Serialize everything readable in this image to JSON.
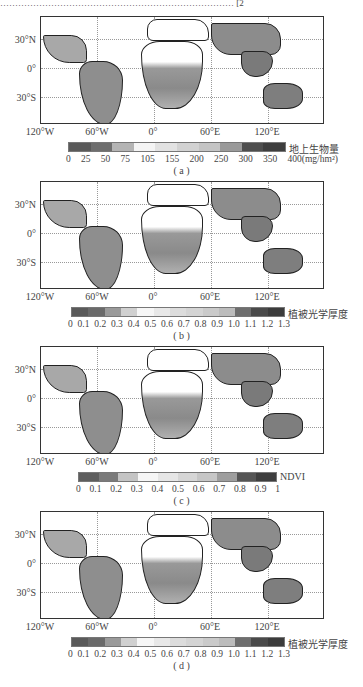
{
  "figure": {
    "top_text_fragment": "…………………………………………………………………… [2",
    "lat_labels": [
      "30°N",
      "0°",
      "30°S"
    ],
    "lon_labels": [
      "120°W",
      "60°W",
      "0°",
      "60°E",
      "120°E"
    ],
    "panels": [
      {
        "id": "a",
        "caption": "( a )",
        "variable_label": "地上生物量",
        "tick_labels": [
          "0",
          "25",
          "50",
          "75",
          "105",
          "155",
          "200",
          "250",
          "300",
          "350",
          "400(mg/hm²)"
        ],
        "colors": [
          "#5a5a5a",
          "#6e6e6e",
          "#b4b4b4",
          "#f4f4f4",
          "#e2e2e2",
          "#d2d2d2",
          "#c4c4c4",
          "#9a9a9a",
          "#4e4e4e",
          "#3e3e3e"
        ]
      },
      {
        "id": "b",
        "caption": "( b )",
        "variable_label": "植被光学厚度",
        "tick_labels": [
          "0",
          "0.1",
          "0.2",
          "0.3",
          "0.4",
          "0.5",
          "0.6",
          "0.7",
          "0.8",
          "0.9",
          "1.0",
          "1.1",
          "1.2",
          "1.3"
        ],
        "colors": [
          "#5a5a5a",
          "#6a6a6a",
          "#9a9a9a",
          "#d0d0d0",
          "#f6f6f6",
          "#e8e8e8",
          "#dcdcdc",
          "#d4d4d4",
          "#cacaca",
          "#bcbcbc",
          "#6e6e6e",
          "#4a4a4a",
          "#3c3c3c"
        ]
      },
      {
        "id": "c",
        "caption": "( c )",
        "variable_label": "NDVI",
        "tick_labels": [
          "0",
          "0.1",
          "0.2",
          "0.3",
          "0.4",
          "0.5",
          "0.6",
          "0.7",
          "0.8",
          "0.9",
          "1"
        ],
        "colors": [
          "#5e5e5e",
          "#7a7a7a",
          "#c4c4c4",
          "#f6f6f6",
          "#e6e6e6",
          "#d6d6d6",
          "#c6c6c6",
          "#9e9e9e",
          "#555555",
          "#3e3e3e"
        ]
      },
      {
        "id": "d",
        "caption": "( d )",
        "variable_label": "植被光学厚度",
        "tick_labels": [
          "0",
          "0.1",
          "0.2",
          "0.3",
          "0.4",
          "0.5",
          "0.6",
          "0.7",
          "0.8",
          "0.9",
          "1.0",
          "1.1",
          "1.2",
          "1.3"
        ],
        "colors": [
          "#5a5a5a",
          "#6a6a6a",
          "#9a9a9a",
          "#d0d0d0",
          "#f6f6f6",
          "#e8e8e8",
          "#dcdcdc",
          "#d4d4d4",
          "#cacaca",
          "#bcbcbc",
          "#6e6e6e",
          "#4a4a4a",
          "#3c3c3c"
        ]
      }
    ]
  }
}
